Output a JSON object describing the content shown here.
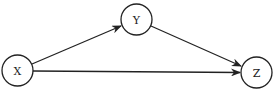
{
  "diagram": {
    "type": "directed-graph",
    "nodes": [
      {
        "id": "X",
        "label": "X",
        "cx": 17.5,
        "cy": 70.5,
        "r": 15.5
      },
      {
        "id": "Y",
        "label": "Y",
        "cx": 136.5,
        "cy": 19.5,
        "r": 15.5
      },
      {
        "id": "Z",
        "label": "Z",
        "cx": 256.5,
        "cy": 72.5,
        "r": 15.5
      }
    ],
    "edges": [
      {
        "from": "X",
        "to": "Y"
      },
      {
        "from": "Y",
        "to": "Z"
      },
      {
        "from": "X",
        "to": "Z"
      }
    ],
    "colors": {
      "stroke": "#222222",
      "background": "#ffffff"
    }
  }
}
